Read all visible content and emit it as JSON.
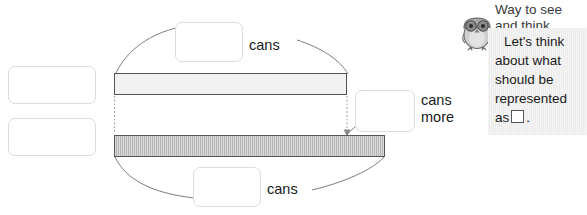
{
  "diagram": {
    "name": "comparison-tape-diagram",
    "top_bar": {
      "label_word": "cans",
      "answer_placeholder": ""
    },
    "bottom_bar": {
      "label_word": "cans",
      "answer_placeholder": ""
    },
    "difference": {
      "label_word": "cans\nmore",
      "answer_placeholder": ""
    }
  },
  "left_boxes": [
    {
      "name": "left-answer-box-top",
      "value": ""
    },
    {
      "name": "left-answer-box-bottom",
      "value": ""
    }
  ],
  "hint": {
    "title": "Way to see\nand think",
    "body_line1": "Let's think",
    "body_line2": "about what",
    "body_line3": "should be",
    "body_line4": "represented",
    "body_line5_prefix": "as",
    "body_line5_suffix": ".",
    "icon": "owl-mascot-icon",
    "background_color": "#ececec"
  },
  "colors": {
    "page_background": "#ffffff",
    "bar_top_fill": "#f2f2f2",
    "bar_bottom_fill": "#b3b3b3",
    "bar_stroke": "#555555",
    "box_border": "#dcdcdc",
    "text": "#1a1a1a"
  }
}
